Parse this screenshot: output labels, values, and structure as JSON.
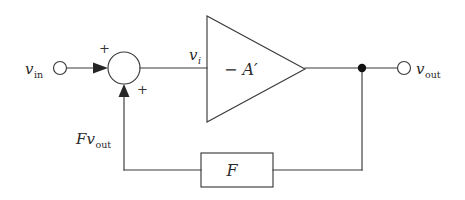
{
  "diagram": {
    "type": "signal-flow-block-diagram",
    "background_color": "#ffffff",
    "line_color": "#3b3b3b",
    "text_color": "#2a2a2a"
  },
  "labels": {
    "input_signal": "v",
    "input_signal_sub": "in",
    "node_output_signal": "v",
    "node_output_signal_sub": "i",
    "amplifier_gain": "− A′",
    "feedback_block": "F",
    "feedback_signal": "F",
    "feedback_signal_var": "v",
    "feedback_signal_sub": "out",
    "output_signal": "v",
    "output_signal_sub": "out",
    "sum_sign_top": "+",
    "sum_sign_bottom": "+"
  },
  "geometry": {
    "input_terminal": {
      "cx": 60,
      "cy": 68,
      "r": 6.5
    },
    "summing_node": {
      "cx": 124,
      "cy": 68,
      "r": 16
    },
    "amplifier_triangle": {
      "x_left": 207,
      "x_apex": 305,
      "y_top": 16,
      "y_bottom": 122,
      "y_apex": 69
    },
    "output_junction": {
      "cx": 362,
      "cy": 68,
      "r": 4.2
    },
    "output_terminal": {
      "cx": 404,
      "cy": 68,
      "r": 6.5
    },
    "feedback_block": {
      "x": 201,
      "y": 153,
      "width": 72,
      "height": 34
    },
    "feedback_return_x": 124,
    "feedback_bus_y": 170
  }
}
